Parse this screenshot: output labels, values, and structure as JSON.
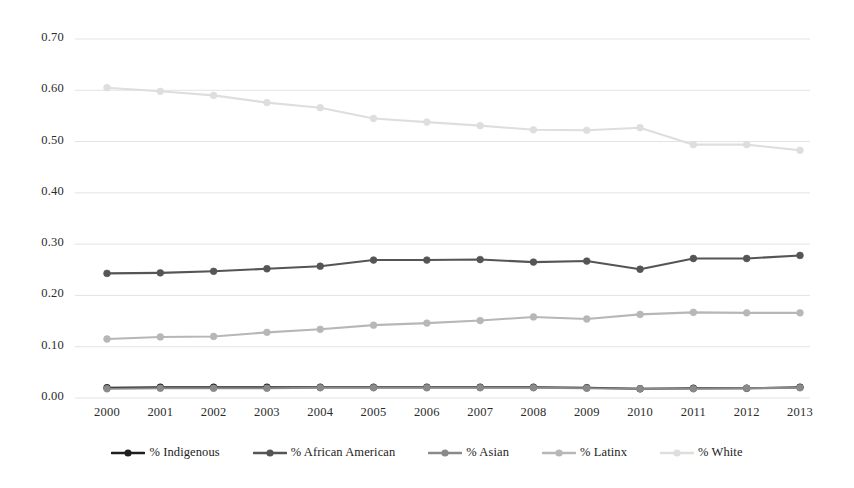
{
  "chart_data": {
    "type": "line",
    "title": "",
    "subtitle": "",
    "xlabel": "",
    "ylabel": "",
    "categories": [
      "2000",
      "2001",
      "2002",
      "2003",
      "2004",
      "2005",
      "2006",
      "2007",
      "2008",
      "2009",
      "2010",
      "2011",
      "2012",
      "2013"
    ],
    "x": [
      2000,
      2001,
      2002,
      2003,
      2004,
      2005,
      2006,
      2007,
      2008,
      2009,
      2010,
      2011,
      2012,
      2013
    ],
    "ylim": [
      0.0,
      0.7
    ],
    "yticks": [
      0.0,
      0.1,
      0.2,
      0.3,
      0.4,
      0.5,
      0.6,
      0.7
    ],
    "ytick_labels": [
      "0.00",
      "0.10",
      "0.20",
      "0.30",
      "0.40",
      "0.50",
      "0.60",
      "0.70"
    ],
    "grid": true,
    "grid_axis": "y",
    "legend_position": "bottom",
    "marker": "circle",
    "series": [
      {
        "name": "% Indigenous",
        "color": "#1f1f1f",
        "values": [
          0.02,
          0.021,
          0.021,
          0.021,
          0.021,
          0.021,
          0.021,
          0.021,
          0.021,
          0.02,
          0.018,
          0.019,
          0.019,
          0.021
        ]
      },
      {
        "name": "% African American",
        "color": "#555555",
        "values": [
          0.243,
          0.244,
          0.247,
          0.252,
          0.257,
          0.269,
          0.269,
          0.27,
          0.265,
          0.267,
          0.251,
          0.272,
          0.272,
          0.278
        ]
      },
      {
        "name": "% Asian",
        "color": "#8a8a8a",
        "values": [
          0.018,
          0.019,
          0.019,
          0.019,
          0.02,
          0.02,
          0.02,
          0.02,
          0.02,
          0.019,
          0.018,
          0.018,
          0.019,
          0.02
        ]
      },
      {
        "name": "% Latinx",
        "color": "#b7b7b7",
        "values": [
          0.115,
          0.119,
          0.12,
          0.128,
          0.134,
          0.142,
          0.146,
          0.151,
          0.158,
          0.154,
          0.163,
          0.167,
          0.166,
          0.166
        ]
      },
      {
        "name": "% White",
        "color": "#dedede",
        "values": [
          0.605,
          0.598,
          0.59,
          0.576,
          0.566,
          0.545,
          0.538,
          0.531,
          0.523,
          0.522,
          0.527,
          0.494,
          0.494,
          0.483
        ]
      }
    ]
  },
  "axes": {
    "gridline_color": "#e3e3e3",
    "plot_left": 75,
    "plot_right": 810,
    "plot_top": 39,
    "plot_bottom": 398
  }
}
